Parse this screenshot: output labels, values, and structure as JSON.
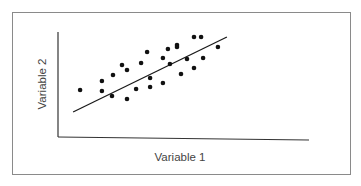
{
  "chart_data": {
    "type": "scatter",
    "title": "",
    "xlabel": "Variable 1",
    "ylabel": "Variable 2",
    "xlim": [
      0,
      10
    ],
    "ylim": [
      0,
      10
    ],
    "grid": false,
    "legend": null,
    "ticks": "none",
    "series": [
      {
        "name": "observations",
        "color": "#111111",
        "points": [
          {
            "x": 0.88,
            "y": 4.48
          },
          {
            "x": 1.75,
            "y": 5.33
          },
          {
            "x": 1.75,
            "y": 4.38
          },
          {
            "x": 2.15,
            "y": 3.9
          },
          {
            "x": 2.19,
            "y": 5.9
          },
          {
            "x": 2.55,
            "y": 6.86
          },
          {
            "x": 2.75,
            "y": 6.38
          },
          {
            "x": 2.75,
            "y": 3.62
          },
          {
            "x": 3.11,
            "y": 4.57
          },
          {
            "x": 3.31,
            "y": 7.05
          },
          {
            "x": 3.55,
            "y": 8.1
          },
          {
            "x": 3.67,
            "y": 5.62
          },
          {
            "x": 3.67,
            "y": 4.76
          },
          {
            "x": 4.18,
            "y": 7.52
          },
          {
            "x": 4.18,
            "y": 5.14
          },
          {
            "x": 4.38,
            "y": 8.38
          },
          {
            "x": 4.46,
            "y": 6.95
          },
          {
            "x": 4.74,
            "y": 8.76
          },
          {
            "x": 4.74,
            "y": 8.57
          },
          {
            "x": 4.9,
            "y": 6.0
          },
          {
            "x": 5.14,
            "y": 7.43
          },
          {
            "x": 5.42,
            "y": 9.52
          },
          {
            "x": 5.42,
            "y": 6.57
          },
          {
            "x": 5.7,
            "y": 9.52
          },
          {
            "x": 5.78,
            "y": 7.52
          },
          {
            "x": 6.37,
            "y": 8.57
          }
        ]
      }
    ],
    "trendline": {
      "name": "regression-line",
      "color": "#1a1a1a",
      "start": {
        "x": 0.6,
        "y": 2.38
      },
      "end": {
        "x": 6.73,
        "y": 9.52
      }
    }
  },
  "labels": {
    "x_axis": "Variable 1",
    "y_axis": "Variable 2"
  }
}
